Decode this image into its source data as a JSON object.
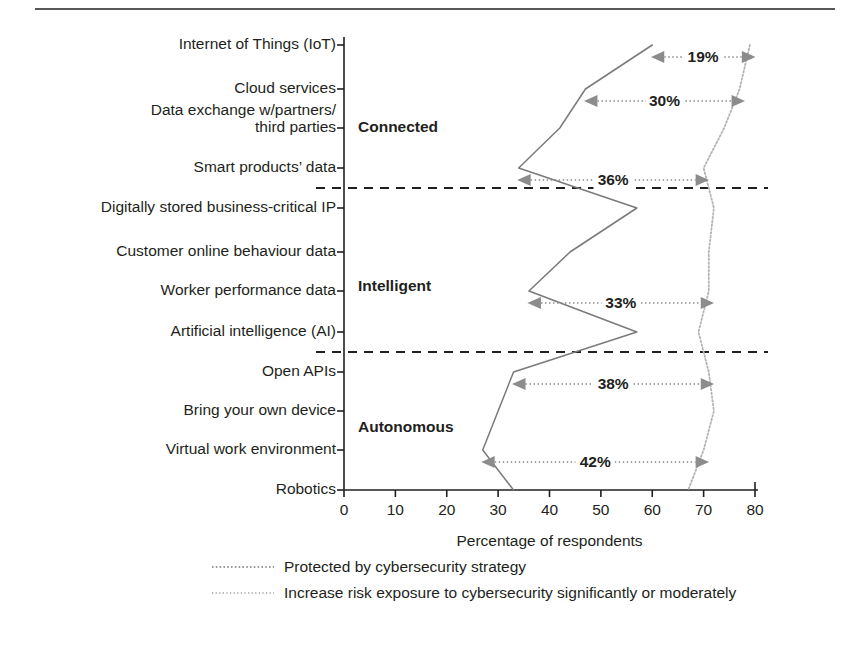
{
  "chart_data": {
    "type": "line",
    "title": "",
    "xlabel": "Percentage of respondents",
    "ylabel": "",
    "xlim": [
      0,
      80
    ],
    "xticks": [
      0,
      10,
      20,
      30,
      40,
      50,
      60,
      70,
      80
    ],
    "orientation": "horizontal-categories",
    "grid": false,
    "legend_position": "bottom",
    "categories": [
      "Internet of Things (IoT)",
      "Cloud services",
      "Data exchange w/partners/ third parties",
      "Smart products’ data",
      "Digitally stored business-critical IP",
      "Customer online behaviour data",
      "Worker performance data",
      "Artificial intelligence (AI)",
      "Open APIs",
      "Bring your own device",
      "Virtual work environment",
      "Robotics"
    ],
    "series": [
      {
        "name": "Protected by cybersecurity strategy",
        "style": "solid-thin",
        "values": [
          60,
          47,
          42,
          34,
          57,
          44,
          36,
          57,
          33,
          30,
          27,
          33
        ]
      },
      {
        "name": "Increase risk exposure to cybersecurity significantly or moderately",
        "style": "dotted",
        "values": [
          79,
          77,
          74,
          70,
          72,
          71,
          71,
          69,
          71,
          72,
          70,
          67
        ]
      }
    ],
    "groups": [
      {
        "label": "Connected",
        "from_category": 0,
        "to_category": 3
      },
      {
        "label": "Intelligent",
        "from_category": 4,
        "to_category": 7
      },
      {
        "label": "Autonomous",
        "from_category": 8,
        "to_category": 11
      }
    ],
    "gap_annotations": [
      {
        "label": "19%",
        "category": "Internet of Things (IoT)",
        "from": 60,
        "to": 79
      },
      {
        "label": "30%",
        "category": "Cloud services",
        "from": 47,
        "to": 77
      },
      {
        "label": "36%",
        "category": "Smart products’ data",
        "from": 34,
        "to": 70
      },
      {
        "label": "33%",
        "category": "Worker performance data",
        "from": 36,
        "to": 71
      },
      {
        "label": "38%",
        "category": "Open APIs",
        "from": 33,
        "to": 71
      },
      {
        "label": "42%",
        "category": "Virtual work environment",
        "from": 27,
        "to": 70
      }
    ]
  },
  "axis": {
    "x_title": "Percentage of respondents",
    "tick_labels": [
      "0",
      "10",
      "20",
      "30",
      "40",
      "50",
      "60",
      "70",
      "80"
    ]
  },
  "categories": [
    {
      "lines": [
        "Internet of Things (IoT)"
      ]
    },
    {
      "lines": [
        "Cloud services"
      ]
    },
    {
      "lines": [
        "Data exchange w/partners/",
        "third parties"
      ]
    },
    {
      "lines": [
        "Smart products’ data"
      ]
    },
    {
      "lines": [
        "Digitally stored business-critical IP"
      ]
    },
    {
      "lines": [
        "Customer online behaviour data"
      ]
    },
    {
      "lines": [
        "Worker performance data"
      ]
    },
    {
      "lines": [
        "Artificial intelligence (AI)"
      ]
    },
    {
      "lines": [
        "Open APIs"
      ]
    },
    {
      "lines": [
        "Bring your own device"
      ]
    },
    {
      "lines": [
        "Virtual work environment"
      ]
    },
    {
      "lines": [
        "Robotics"
      ]
    }
  ],
  "groups": [
    {
      "label": "Connected"
    },
    {
      "label": "Intelligent"
    },
    {
      "label": "Autonomous"
    }
  ],
  "gaps": [
    {
      "label": "19%"
    },
    {
      "label": "30%"
    },
    {
      "label": "36%"
    },
    {
      "label": "33%"
    },
    {
      "label": "38%"
    },
    {
      "label": "42%"
    }
  ],
  "legend": [
    {
      "label": "Protected by cybersecurity strategy"
    },
    {
      "label": "Increase risk exposure to cybersecurity significantly or moderately"
    }
  ],
  "colors": {
    "axis": "#231f20",
    "rule": "#58595b",
    "series_protected": "#7a7a7a",
    "series_risk": "#b4b4b4",
    "annotation": "#8c8c8c"
  }
}
